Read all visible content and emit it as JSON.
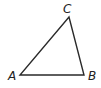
{
  "diagram": {
    "type": "triangle",
    "vertices": [
      {
        "label": "A",
        "x": 20,
        "y": 75
      },
      {
        "label": "B",
        "x": 84,
        "y": 75
      },
      {
        "label": "C",
        "x": 69,
        "y": 17
      }
    ],
    "labels": {
      "A": "A",
      "B": "B",
      "C": "C"
    },
    "stroke_color": "#2a2a2a"
  }
}
